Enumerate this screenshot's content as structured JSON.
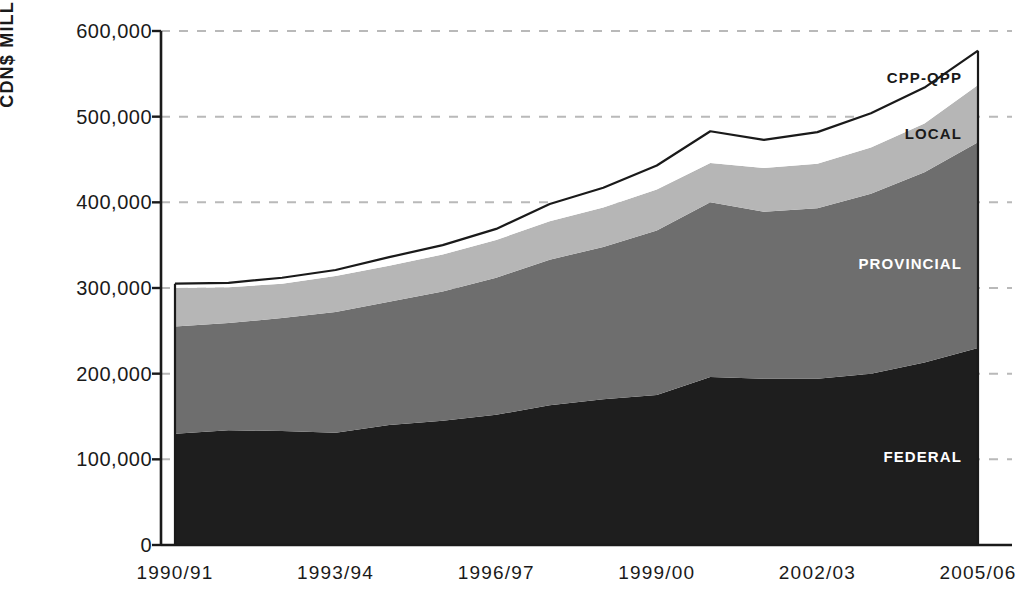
{
  "chart_data": {
    "type": "area",
    "title": "",
    "xlabel": "",
    "ylabel": "CDN$ MILLIONS",
    "stacked": true,
    "grid": "horizontal-dashed",
    "legend_position": "inline-right",
    "ylim": [
      0,
      600000
    ],
    "ytick_labels": [
      "600,000",
      "500,000",
      "400,000",
      "300,000",
      "200,000",
      "100,000",
      "0"
    ],
    "ytick_values": [
      600000,
      500000,
      400000,
      300000,
      200000,
      100000,
      0
    ],
    "xtick_labels": [
      "1990/91",
      "1993/94",
      "1996/97",
      "1999/00",
      "2002/03",
      "2005/06"
    ],
    "x": [
      "1990/91",
      "1991/92",
      "1992/93",
      "1993/94",
      "1994/95",
      "1995/96",
      "1996/97",
      "1997/98",
      "1998/99",
      "1999/00",
      "2000/01",
      "2001/02",
      "2002/03",
      "2003/04",
      "2004/05",
      "2005/06"
    ],
    "series": [
      {
        "name": "FEDERAL",
        "color": "#1e1e1e",
        "values": [
          130000,
          134000,
          133000,
          131000,
          140000,
          145000,
          152000,
          163000,
          170000,
          175000,
          196000,
          194000,
          194000,
          200000,
          213000,
          230000
        ]
      },
      {
        "name": "PROVINCIAL",
        "color": "#6e6e6e",
        "values": [
          125000,
          125000,
          132000,
          141000,
          144000,
          151000,
          160000,
          170000,
          178000,
          192000,
          204000,
          195000,
          199000,
          210000,
          222000,
          240000
        ]
      },
      {
        "name": "LOCAL",
        "color": "#b6b6b6",
        "values": [
          45000,
          42000,
          40000,
          42000,
          42000,
          43000,
          44000,
          45000,
          46000,
          48000,
          46000,
          51000,
          52000,
          54000,
          57000,
          67000
        ]
      },
      {
        "name": "CPP-QPP",
        "color": "#ffffff",
        "values": [
          5000,
          5000,
          7000,
          7000,
          10000,
          11000,
          13000,
          20000,
          23000,
          28000,
          37000,
          33000,
          37000,
          40000,
          42000,
          40000
        ]
      }
    ],
    "totals": [
      305000,
      306000,
      312000,
      321000,
      336000,
      350000,
      369000,
      398000,
      417000,
      443000,
      483000,
      473000,
      482000,
      504000,
      534000,
      577000
    ],
    "annotations": [
      {
        "text": "CPP-QPP",
        "series": "CPP-QPP"
      },
      {
        "text": "LOCAL",
        "series": "LOCAL"
      },
      {
        "text": "PROVINCIAL",
        "series": "PROVINCIAL"
      },
      {
        "text": "FEDERAL",
        "series": "FEDERAL"
      }
    ]
  },
  "labels": {
    "y_axis_title": "CDN$ MILLIONS",
    "series_federal": "FEDERAL",
    "series_provincial": "PROVINCIAL",
    "series_local": "LOCAL",
    "series_cpp": "CPP-QPP"
  },
  "colors": {
    "federal": "#1e1e1e",
    "provincial": "#6e6e6e",
    "local": "#b6b6b6",
    "cpp_qpp": "#ffffff",
    "axis": "#1a1a1a",
    "grid": "#b9b9b9"
  }
}
